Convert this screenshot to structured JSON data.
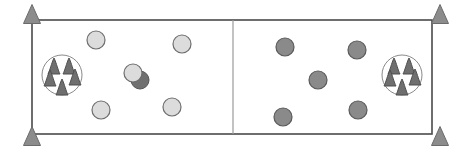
{
  "diagram": {
    "type": "robot-soccer-field-schematic",
    "canvas": {
      "width": 463,
      "height": 152,
      "background": "#ffffff"
    },
    "field": {
      "name": "playing-field-rectangle",
      "x": 32,
      "y": 20,
      "width": 400,
      "height": 114,
      "fill": "#ffffff",
      "stroke": "#4a4a4a",
      "stroke_width": 1.6
    },
    "center_line": {
      "name": "center-divider-line",
      "x": 233,
      "y1": 20,
      "y2": 134,
      "stroke": "#9a9a9a",
      "stroke_width": 1.2
    },
    "corner_markers": {
      "shape": "triangle",
      "fill": "#8c8c8c",
      "stroke": "#6b6b6b",
      "count": 4,
      "items": [
        {
          "label": "corner-marker-top-left",
          "cx": 32,
          "cy": 14,
          "w": 17,
          "h": 19
        },
        {
          "label": "corner-marker-top-right",
          "cx": 440,
          "cy": 14,
          "w": 17,
          "h": 19
        },
        {
          "label": "corner-marker-bottom-left",
          "cx": 32,
          "cy": 136,
          "w": 17,
          "h": 19
        },
        {
          "label": "corner-marker-bottom-right",
          "cx": 440,
          "cy": 136,
          "w": 17,
          "h": 19
        }
      ]
    },
    "teams": [
      {
        "name": "light-team",
        "side": "left",
        "marker_fill": "#dcdcdc",
        "marker_stroke": "#6e6e6e",
        "marker_radius": 9,
        "count": 5,
        "markers": [
          {
            "label": "light-marker-1",
            "cx": 96,
            "cy": 40
          },
          {
            "label": "light-marker-2",
            "cx": 182,
            "cy": 44
          },
          {
            "label": "light-marker-3",
            "cx": 133,
            "cy": 73
          },
          {
            "label": "light-marker-4",
            "cx": 101,
            "cy": 110
          },
          {
            "label": "light-marker-5",
            "cx": 172,
            "cy": 107
          }
        ]
      },
      {
        "name": "dark-team",
        "side": "right",
        "marker_fill": "#8a8a8a",
        "marker_stroke": "#5a5a5a",
        "marker_radius": 9,
        "count": 5,
        "markers": [
          {
            "label": "dark-marker-1",
            "cx": 285,
            "cy": 47
          },
          {
            "label": "dark-marker-2",
            "cx": 357,
            "cy": 50
          },
          {
            "label": "dark-marker-3",
            "cx": 318,
            "cy": 80
          },
          {
            "label": "dark-marker-4",
            "cx": 283,
            "cy": 117
          },
          {
            "label": "dark-marker-5",
            "cx": 358,
            "cy": 110
          }
        ]
      }
    ],
    "occluded_marker": {
      "name": "occluded-dark-marker",
      "cx": 140,
      "cy": 80,
      "r": 9,
      "fill": "#707070",
      "stroke": "#555555",
      "note": "dark circle partially hidden behind light-marker-3"
    },
    "cone_clusters": [
      {
        "name": "left-cone-cluster",
        "circle": {
          "cx": 62,
          "cy": 75,
          "r": 20,
          "stroke": "#8a8a8a",
          "fill": "none"
        },
        "cone_fill": "#6f6f6f",
        "cone_stroke": "#4f4f4f",
        "count": 5,
        "cones": [
          {
            "label": "cone-1",
            "cx": 54,
            "cy": 66,
            "w": 12,
            "h": 16
          },
          {
            "label": "cone-2",
            "cx": 69,
            "cy": 66,
            "w": 12,
            "h": 16
          },
          {
            "label": "cone-3",
            "cx": 50,
            "cy": 78,
            "w": 12,
            "h": 16
          },
          {
            "label": "cone-4",
            "cx": 75,
            "cy": 77,
            "w": 12,
            "h": 16
          },
          {
            "label": "cone-5",
            "cx": 62,
            "cy": 87,
            "w": 12,
            "h": 16
          }
        ]
      },
      {
        "name": "right-cone-cluster",
        "circle": {
          "cx": 402,
          "cy": 75,
          "r": 20,
          "stroke": "#8a8a8a",
          "fill": "none"
        },
        "cone_fill": "#6f6f6f",
        "cone_stroke": "#4f4f4f",
        "count": 5,
        "cones": [
          {
            "label": "cone-1",
            "cx": 394,
            "cy": 66,
            "w": 12,
            "h": 16
          },
          {
            "label": "cone-2",
            "cx": 409,
            "cy": 66,
            "w": 12,
            "h": 16
          },
          {
            "label": "cone-3",
            "cx": 390,
            "cy": 78,
            "w": 12,
            "h": 16
          },
          {
            "label": "cone-4",
            "cx": 415,
            "cy": 77,
            "w": 12,
            "h": 16
          },
          {
            "label": "cone-5",
            "cx": 402,
            "cy": 87,
            "w": 12,
            "h": 16
          }
        ]
      }
    ]
  }
}
